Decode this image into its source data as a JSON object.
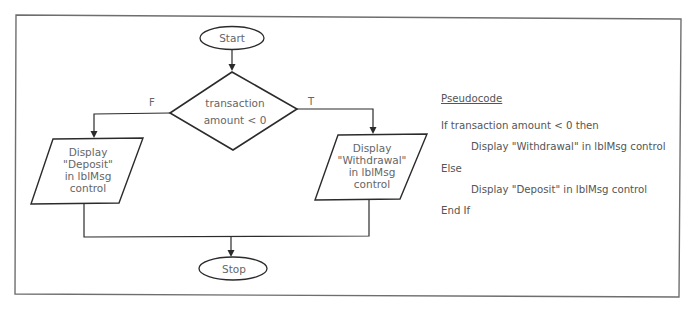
{
  "flowchart": {
    "start_label": "Start",
    "stop_label": "Stop",
    "decision": {
      "line1": "transaction",
      "line2": "amount < 0"
    },
    "false_branch_label": "F",
    "true_branch_label": "T",
    "false_output": {
      "line1": "Display",
      "line2": "\"Deposit\"",
      "line3": "in lblMsg",
      "line4": "control"
    },
    "true_output": {
      "line1": "Display",
      "line2": "\"Withdrawal\"",
      "line3": "in lblMsg",
      "line4": "control"
    }
  },
  "pseudocode": {
    "heading": "Pseudocode",
    "lines": [
      "If transaction amount < 0 then",
      "Display \"Withdrawal\" in lblMsg control",
      "Else",
      "Display \"Deposit\" in lblMsg control",
      "End If"
    ]
  },
  "colors": {
    "stroke": "#2b2b2b",
    "frame": "#6e6e6e",
    "text": "#666666"
  }
}
